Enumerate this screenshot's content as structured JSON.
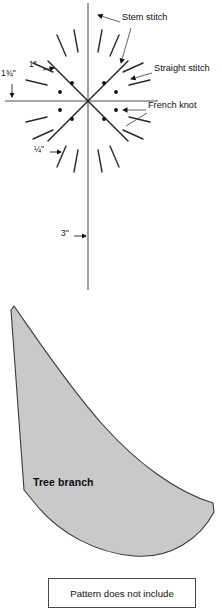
{
  "page": {
    "type": "embroidery-pattern-diagram",
    "width": 222,
    "height": 601,
    "background_color": "#ffffff"
  },
  "diagram": {
    "name": "stitch-placement-diagram",
    "axis_color": "#8a8a8a",
    "stitch_color": "#2b2b2b",
    "knot_color": "#111111",
    "center": {
      "x": 88,
      "y": 101
    },
    "axes": {
      "vertical": {
        "x": 88,
        "y_top": 3,
        "y_bottom": 290
      },
      "horizontal": {
        "y": 101,
        "x_left": 5,
        "x_right": 158
      }
    },
    "stem_stitch_rays": [
      {
        "angle_deg": 45,
        "length": 56
      },
      {
        "angle_deg": 135,
        "length": 56
      },
      {
        "angle_deg": 225,
        "length": 56
      },
      {
        "angle_deg": 315,
        "length": 56
      },
      {
        "angle_deg": 0,
        "length": 46
      },
      {
        "angle_deg": 90,
        "length": 46
      },
      {
        "angle_deg": 180,
        "length": 46
      },
      {
        "angle_deg": 270,
        "length": 46
      }
    ],
    "straight_stitches": [
      {
        "angle_deg": 15,
        "inner_r": 44,
        "outer_r": 66
      },
      {
        "angle_deg": 67,
        "inner_r": 44,
        "outer_r": 66
      },
      {
        "angle_deg": 75,
        "inner_r": 40,
        "outer_r": 62
      },
      {
        "angle_deg": 112,
        "inner_r": 44,
        "outer_r": 66
      },
      {
        "angle_deg": 105,
        "inner_r": 40,
        "outer_r": 62
      },
      {
        "angle_deg": 165,
        "inner_r": 44,
        "outer_r": 66
      },
      {
        "angle_deg": 195,
        "inner_r": 44,
        "outer_r": 66
      },
      {
        "angle_deg": 247,
        "inner_r": 44,
        "outer_r": 66
      },
      {
        "angle_deg": 255,
        "inner_r": 40,
        "outer_r": 62
      },
      {
        "angle_deg": 285,
        "inner_r": 40,
        "outer_r": 62
      },
      {
        "angle_deg": 292,
        "inner_r": 44,
        "outer_r": 66
      },
      {
        "angle_deg": 345,
        "inner_r": 44,
        "outer_r": 66
      }
    ],
    "french_knots": [
      {
        "x": 72,
        "y": 83
      },
      {
        "x": 104,
        "y": 83
      },
      {
        "x": 60,
        "y": 92
      },
      {
        "x": 116,
        "y": 92
      },
      {
        "x": 60,
        "y": 110
      },
      {
        "x": 116,
        "y": 110
      },
      {
        "x": 72,
        "y": 119
      },
      {
        "x": 104,
        "y": 119
      }
    ],
    "knot_radius": 1.9
  },
  "callouts": [
    {
      "id": "stem-stitch",
      "label": "Stem stitch",
      "text_x": 122,
      "text_y": 18,
      "leaders": [
        {
          "x1": 120,
          "y1": 22,
          "x2": 96,
          "y2": 15
        },
        {
          "x1": 130,
          "y1": 27,
          "x2": 119,
          "y2": 64
        }
      ],
      "arrows": [
        {
          "x": 94,
          "y": 14,
          "angle_deg": 200
        },
        {
          "x": 120,
          "y": 66,
          "angle_deg": 70
        }
      ]
    },
    {
      "id": "straight-stitch",
      "label": "Straight stitch",
      "text_x": 154,
      "text_y": 69,
      "leaders": [
        {
          "x1": 152,
          "y1": 73,
          "x2": 130,
          "y2": 80
        }
      ],
      "arrows": [
        {
          "x": 128,
          "y": 81,
          "angle_deg": 160
        }
      ]
    },
    {
      "id": "french-knot",
      "label": "French knot",
      "text_x": 148,
      "text_y": 106,
      "leaders": [
        {
          "x1": 146,
          "y1": 110,
          "x2": 122,
          "y2": 110
        },
        {
          "x1": 146,
          "y1": 112,
          "x2": 124,
          "y2": 124
        }
      ],
      "arrows": [
        {
          "x": 120,
          "y": 110,
          "angle_deg": 180
        }
      ]
    }
  ],
  "dimensions": [
    {
      "id": "dim-1-3-4-inch",
      "label": "1¾\"",
      "text_x": 2,
      "text_y": 74,
      "arrow": {
        "x": 12,
        "y": 99,
        "angle_deg": 90
      },
      "leader": {
        "x1": 12,
        "y1": 84,
        "x2": 12,
        "y2": 96
      }
    },
    {
      "id": "dim-1-inch",
      "label": "1\"",
      "text_x": 30,
      "text_y": 65,
      "arrow": {
        "x": 53,
        "y": 69,
        "angle_deg": 10
      },
      "leader": {
        "x1": 43,
        "y1": 70,
        "x2": 51,
        "y2": 69
      }
    },
    {
      "id": "dim-1-4-inch",
      "label": "¼\"",
      "text_x": 36,
      "text_y": 148,
      "arrow": {
        "x": 60,
        "y": 152,
        "angle_deg": 0
      },
      "leader": {
        "x1": 50,
        "y1": 152,
        "x2": 58,
        "y2": 152
      }
    },
    {
      "id": "dim-3-inch",
      "label": "3\"",
      "text_x": 62,
      "text_y": 232,
      "arrow": {
        "x": 86,
        "y": 236,
        "angle_deg": 0
      },
      "leader": {
        "x1": 74,
        "y1": 236,
        "x2": 84,
        "y2": 236
      }
    }
  ],
  "branch": {
    "name": "tree-branch-pattern-piece",
    "label": "Tree branch",
    "label_x": 33,
    "label_y": 482,
    "fill_color": "#c9c9c9",
    "stroke_color": "#3a3a3a",
    "path": "M 11,310 L 14,306 C 35,336 68,386 103,425 C 136,462 176,492 213,503 L 214,512 C 200,539 170,559 134,556 C 96,553 60,533 38,507 L 29,496 L 24,490 Z"
  },
  "caption": {
    "name": "pattern-note-box",
    "text": "Pattern does not include"
  }
}
